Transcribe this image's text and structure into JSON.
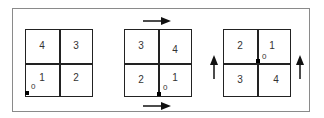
{
  "diagrams": [
    {
      "cells": {
        "top_left": "4",
        "top_right": "3",
        "bottom_left": "1",
        "bottom_right": "2"
      },
      "origin_label": "0",
      "origin_position": "bottom-left corner"
    },
    {
      "cells": {
        "top_left": "3",
        "top_right": "4",
        "bottom_left": "2",
        "bottom_right": "1"
      },
      "origin_label": "0",
      "origin_position": "bottom-center",
      "arrows": [
        "right (above grid)",
        "right (below grid)"
      ]
    },
    {
      "cells": {
        "top_left": "2",
        "top_right": "1",
        "bottom_left": "3",
        "bottom_right": "4"
      },
      "origin_label": "0",
      "origin_position": "center",
      "arrows": [
        "up (left of grid)",
        "up (right of grid)"
      ]
    }
  ],
  "colors": {
    "line": "#222222",
    "frame": "#8a8a8a",
    "text": "#333333"
  }
}
